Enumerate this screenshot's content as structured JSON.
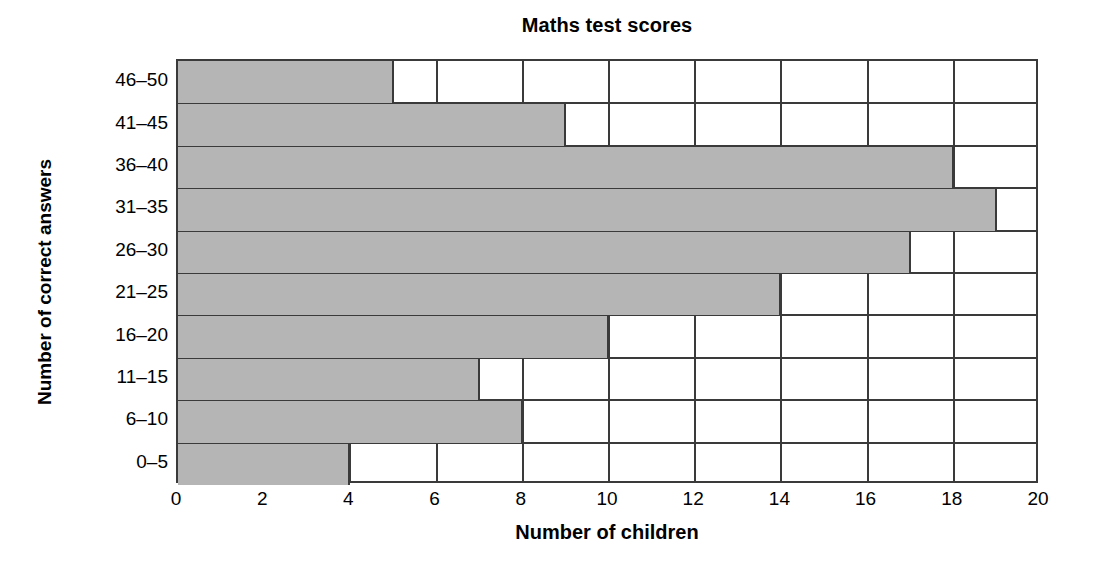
{
  "chart_data": {
    "type": "bar",
    "orientation": "horizontal",
    "title": "Maths test scores",
    "xlabel": "Number of children",
    "ylabel": "Number of correct answers",
    "categories": [
      "0–5",
      "6–10",
      "11–15",
      "16–20",
      "21–25",
      "26–30",
      "31–35",
      "36–40",
      "41–45",
      "46–50"
    ],
    "values": [
      4,
      8,
      7,
      10,
      14,
      17,
      19,
      18,
      9,
      5
    ],
    "xlim": [
      0,
      20
    ],
    "x_ticks": [
      0,
      2,
      4,
      6,
      8,
      10,
      12,
      14,
      16,
      18,
      20
    ],
    "x_tick_labels": [
      "0",
      "2",
      "4",
      "6",
      "8",
      "10",
      "12",
      "14",
      "16",
      "18",
      "20"
    ],
    "x_tick_step": 2,
    "grid": "vertical-only",
    "legend": "none",
    "bar_fill_color": "#b5b5b5",
    "bar_border_color": "#3a3a3a",
    "axis_color": "#3a3a3a",
    "background_color": "#ffffff"
  }
}
